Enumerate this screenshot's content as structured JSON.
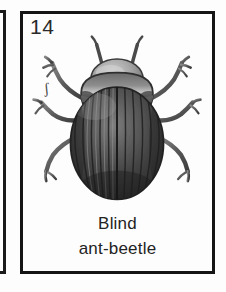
{
  "card": {
    "number": "14",
    "scale_mark": "ʃ",
    "caption": {
      "line1": "Blind",
      "line2": "ant-beetle"
    },
    "illustration": {
      "subject": "beetle-illustration",
      "description": "Dorsal view engraving of a dark oval beetle with striated elytra, broad pronotum, rounded head, two antennae and six legs",
      "style": "halftone-engraving",
      "parts": [
        "head",
        "antenna-left",
        "antenna-right",
        "pronotum",
        "elytra",
        "elytra-striations",
        "leg-front-left",
        "leg-front-right",
        "leg-middle-left",
        "leg-middle-right",
        "leg-hind-left",
        "leg-hind-right"
      ]
    }
  },
  "colors": {
    "border": "#151515",
    "paper": "#fdfdfd",
    "ink": "#232323",
    "number_ink": "#2a2a2a",
    "beetle_dark": "#3b3b3b",
    "beetle_mid": "#6d6d6d",
    "beetle_light": "#b4b4b4",
    "beetle_outline": "#2a2a2a"
  },
  "neighbor_card": {
    "label": "adjacent-card-partial-frame"
  }
}
